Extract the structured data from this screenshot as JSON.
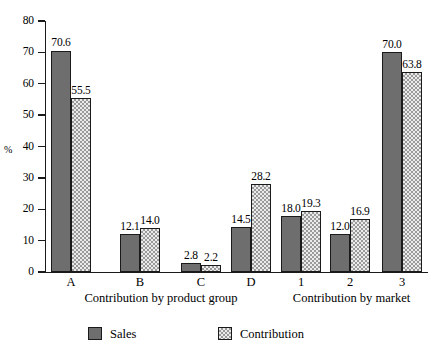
{
  "chart_data": {
    "type": "bar",
    "title": "",
    "xlabel": "",
    "ylabel": "%",
    "ylim": [
      0,
      80
    ],
    "ytick_step": 10,
    "yticks": [
      "0",
      "10",
      "20",
      "30",
      "40",
      "50",
      "60",
      "70",
      "80"
    ],
    "grid": false,
    "legend_position": "bottom",
    "categories": [
      "A",
      "B",
      "C",
      "D",
      "1",
      "2",
      "3"
    ],
    "group_labels": [
      "Contribution by product group",
      "Contribution by market"
    ],
    "groups": [
      {
        "label": "Contribution by product group",
        "categories": [
          "A",
          "B",
          "C",
          "D"
        ]
      },
      {
        "label": "Contribution by market",
        "categories": [
          "1",
          "2",
          "3"
        ]
      }
    ],
    "series": [
      {
        "name": "Sales",
        "color": "#6e6e6e",
        "pattern": "solid",
        "values": [
          70.6,
          12.1,
          2.8,
          14.5,
          18.0,
          12.0,
          70.0
        ],
        "labels": [
          "70.6",
          "12.1",
          "2.8",
          "14.5",
          "18.0",
          "12.0",
          "70.0"
        ]
      },
      {
        "name": "Contribution",
        "color": "#ebebeb",
        "pattern": "dotted-checker",
        "values": [
          55.5,
          14.0,
          2.2,
          28.2,
          19.3,
          16.9,
          63.8
        ],
        "labels": [
          "55.5",
          "14.0",
          "2.2",
          "28.2",
          "19.3",
          "16.9",
          "63.8"
        ]
      }
    ]
  },
  "legend": {
    "items": [
      {
        "label": "Sales",
        "swatch": "sales"
      },
      {
        "label": "Contribution",
        "swatch": "contribution"
      }
    ]
  },
  "axis": {
    "y_title": "%"
  }
}
